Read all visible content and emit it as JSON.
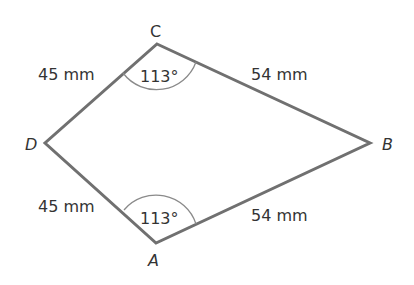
{
  "figure": {
    "type": "kite quadrilateral",
    "colors": {
      "background": "#ffffff",
      "stroke": "#707070",
      "arc": "#8a8a8a",
      "text": "#333333"
    },
    "vertices": {
      "A": {
        "label": "A",
        "x": 156,
        "y": 243
      },
      "B": {
        "label": "B",
        "x": 370,
        "y": 143
      },
      "C": {
        "label": "C",
        "x": 157,
        "y": 44
      },
      "D": {
        "label": "D",
        "x": 45,
        "y": 143
      }
    },
    "sides": {
      "CD": {
        "label": "45 mm"
      },
      "CB": {
        "label": "54 mm"
      },
      "DA": {
        "label": "45 mm"
      },
      "AB": {
        "label": "54 mm"
      }
    },
    "angles": {
      "C": {
        "label": "113°"
      },
      "A": {
        "label": "113°"
      }
    }
  }
}
